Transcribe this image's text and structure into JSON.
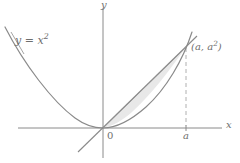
{
  "figure": {
    "kind": "math-diagram",
    "background_color": "#ffffff",
    "axis_color": "#8a8a8a",
    "curve_color": "#8a8a8a",
    "line_color": "#8a8a8a",
    "shade_fill_color": "#e8e8e8",
    "shade_stroke_color": "#909090",
    "dash_color": "#b0b0b0",
    "label_color": "#6e6e6e"
  },
  "labels": {
    "curve_equation_base": "y = x",
    "curve_equation_exponent": "2",
    "point_label_open": "(a, a",
    "point_label_exponent": "2",
    "point_label_close": ")",
    "x_axis": "x",
    "y_axis": "y",
    "origin": "0",
    "x_tick": "a"
  },
  "geometry": {
    "origin_px": [
      103,
      128
    ],
    "point_a_px": [
      186,
      47
    ],
    "x_axis_span_px": [
      18,
      222
    ],
    "y_axis_span_px": [
      8,
      158
    ],
    "parabola_left_end_px": [
      5,
      28
    ],
    "dashed_line_x_px": 186,
    "secant_extension_low_px": [
      78,
      150
    ],
    "secant_extension_high_px": [
      196,
      36
    ],
    "parabola_extension_high_px": [
      192,
      33
    ]
  }
}
